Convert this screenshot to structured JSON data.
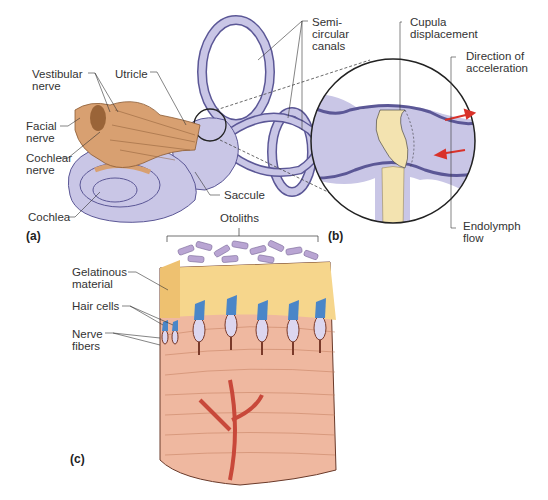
{
  "figure": {
    "panels": {
      "a": "(a)",
      "b": "(b)",
      "c": "(c)"
    },
    "labels_a": {
      "vestibular_nerve": "Vestibular\nnerve",
      "utricle": "Utricle",
      "semicircular_canals": "Semi-\ncircular\ncanals",
      "facial_nerve": "Facial\nnerve",
      "cochlear_nerve": "Cochlear\nnerve",
      "cochlea": "Cochlea",
      "saccule": "Saccule"
    },
    "labels_b": {
      "cupula_displacement": "Cupula\ndisplacement",
      "direction_of_acceleration": "Direction of\nacceleration",
      "endolymph_flow": "Endolymph\nflow"
    },
    "labels_c": {
      "otoliths": "Otoliths",
      "gelatinous_material": "Gelatinous\nmaterial",
      "hair_cells": "Hair cells",
      "nerve_fibers": "Nerve\nfibers"
    },
    "colors": {
      "membrane": "#c9c6e6",
      "membrane_outline": "#5b5796",
      "nerve": "#d8a071",
      "gel": "#f6d68c",
      "tissue": "#efb8a0",
      "arrow": "#d9322a",
      "otolith": "#b9a5d3",
      "hair_tip": "#4a86c8"
    }
  }
}
